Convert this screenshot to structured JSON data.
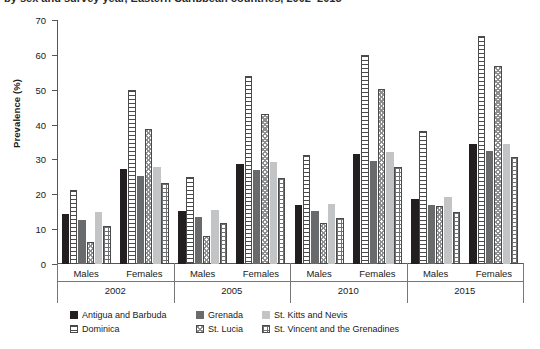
{
  "caption": {
    "text": "by sex and survey year, Eastern Caribbean countries, 2002–2015"
  },
  "chart_data": {
    "type": "bar",
    "title": "",
    "subtitle": "",
    "xlabel": "",
    "ylabel": "Prevalence (%)",
    "ylim": [
      0,
      70
    ],
    "yticks": [
      0,
      10,
      20,
      30,
      40,
      50,
      60,
      70
    ],
    "grid": false,
    "legend_position": "bottom",
    "group_labels": [
      "2002",
      "2005",
      "2010",
      "2015"
    ],
    "sex_labels": [
      "Males",
      "Females"
    ],
    "categories": [
      "2002 Males",
      "2002 Females",
      "2005 Males",
      "2005 Females",
      "2010 Males",
      "2010 Females",
      "2015 Males",
      "2015 Females"
    ],
    "series": [
      {
        "name": "Antigua and Barbuda",
        "pattern": "solid-black",
        "color": "#231f20",
        "values": [
          14.3,
          27.3,
          15.2,
          28.8,
          16.8,
          31.7,
          18.7,
          34.3
        ]
      },
      {
        "name": "Dominica",
        "pattern": "horizontal-stripes",
        "color": "#ffffff",
        "values": [
          21.3,
          50.0,
          25.0,
          54.0,
          31.4,
          60.0,
          38.3,
          65.5
        ]
      },
      {
        "name": "Grenada",
        "pattern": "solid-dark-gray",
        "color": "#696a6c",
        "values": [
          12.7,
          25.3,
          13.4,
          27.0,
          15.1,
          29.6,
          16.8,
          32.5
        ]
      },
      {
        "name": "St. Lucia",
        "pattern": "checkered",
        "color": "#ffffff",
        "values": [
          6.3,
          38.6,
          8.0,
          43.0,
          11.9,
          50.3,
          16.6,
          56.8
        ]
      },
      {
        "name": "St. Kitts and Nevis",
        "pattern": "solid-light-gray",
        "color": "#c3c4c6",
        "values": [
          15.0,
          27.8,
          15.6,
          29.4,
          17.2,
          32.2,
          19.2,
          34.5
        ]
      },
      {
        "name": "St. Vincent and the Grenadines",
        "pattern": "grid",
        "color": "#ffffff",
        "values": [
          10.8,
          23.1,
          11.7,
          24.7,
          13.2,
          27.8,
          14.9,
          30.6
        ]
      }
    ]
  },
  "legend": {
    "row1": [
      {
        "label": "Antigua and Barbuda",
        "swatch": "sw-black"
      },
      {
        "label": "Grenada",
        "swatch": "sw-dgray"
      },
      {
        "label": "St. Kitts and Nevis",
        "swatch": "sw-lgray"
      }
    ],
    "row2": [
      {
        "label": "Dominica",
        "swatch": "sw-hstripe"
      },
      {
        "label": "St. Lucia",
        "swatch": "sw-check"
      },
      {
        "label": "St. Vincent and the Grenadines",
        "swatch": "sw-grid"
      }
    ]
  }
}
